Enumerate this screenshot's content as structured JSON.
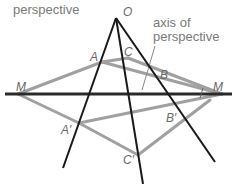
{
  "labels": {
    "center_of_perspective_line2": "perspective",
    "axis_line1": "axis of",
    "axis_line2": "perspective"
  },
  "points": {
    "O": "O",
    "A": "A",
    "B": "B",
    "C": "C",
    "A_prime": "A′",
    "B_prime": "B′",
    "C_prime": "C′",
    "M_left": "M",
    "M_right": "M"
  },
  "colors": {
    "black_lines": "#1a1a1a",
    "gray_lines": "#9a9a9a",
    "label_text": "#7a7a7a"
  }
}
